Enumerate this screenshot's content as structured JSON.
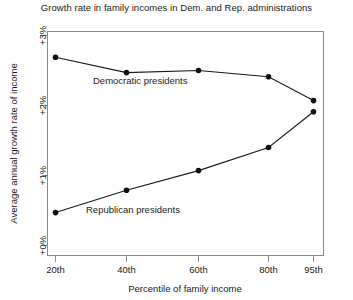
{
  "chart_data": {
    "type": "line",
    "title": "Growth rate in family incomes in Dem. and Rep. administrations",
    "xlabel": "Percentile of family income",
    "ylabel": "Average annual growth rate of income",
    "categories": [
      "20th",
      "40th",
      "60th",
      "80th",
      "95th"
    ],
    "x_tick_labels": [
      "20th",
      "40th",
      "60th",
      "80th",
      "95th"
    ],
    "y_tick_labels": [
      "+0%",
      "+1%",
      "+2%",
      "+3%"
    ],
    "y_tick_values": [
      0,
      1,
      2,
      3
    ],
    "ylim": [
      -0.05,
      3.0
    ],
    "grid": false,
    "legend": "inline-annotations",
    "series": [
      {
        "name": "Democratic presidents",
        "values": [
          2.69,
          2.47,
          2.5,
          2.41,
          2.07
        ],
        "annotation": "Democratic presidents"
      },
      {
        "name": "Republican presidents",
        "values": [
          0.47,
          0.79,
          1.07,
          1.4,
          1.91
        ],
        "annotation": "Republican presidents"
      }
    ],
    "marker": "filled-circle",
    "line_color": "#1a1a1a"
  },
  "colors": {
    "axis": "#8c8c8c",
    "line": "#1a1a1a",
    "marker": "#111111",
    "text": "#1a1a1a",
    "background": "#ffffff"
  },
  "annotations": {
    "democratic_label": "Democratic presidents",
    "republican_label": "Republican presidents"
  }
}
